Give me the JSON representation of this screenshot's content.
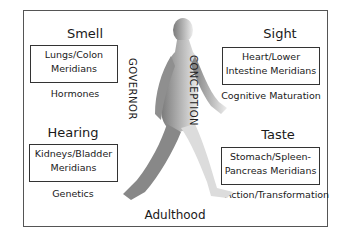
{
  "quadrants": {
    "top_left": {
      "heading": "Smell",
      "box_line1": "Lungs/Colon",
      "box_line2": "Meridians",
      "sub": "Hormones"
    },
    "top_right": {
      "heading": "Sight",
      "box_line1": "Heart/Lower",
      "box_line2": "Intestine Meridians",
      "sub": "Cognitive Maturation"
    },
    "bottom_left": {
      "heading": "Hearing",
      "box_line1": "Kidneys/Bladder",
      "box_line2": "Meridians",
      "sub": "Genetics"
    },
    "bottom_right": {
      "heading": "Taste",
      "box_line1": "Stomach/Spleen-",
      "box_line2": "Pancreas Meridians",
      "sub": "Action/Transformation"
    }
  },
  "vertical_labels": {
    "left": "GOVERNOR",
    "right": "CONCEPTION"
  },
  "caption": "Adulthood",
  "figure": {
    "icon": "walking-human-figure-icon",
    "colors": {
      "body_light": "#e6e6e6",
      "body_dark": "#8a8a8a"
    }
  }
}
